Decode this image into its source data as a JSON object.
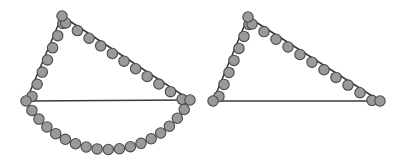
{
  "figure": {
    "background_color": "#ffffff",
    "width": 402,
    "height": 165
  },
  "style": {
    "bead_fill": "#9a9a9a",
    "bead_stroke": "#4a4a4a",
    "bead_radius": 5.2,
    "edge_stroke": "#3a3a3a",
    "edge_width": 1.6
  },
  "chart_data": {
    "type": "scatter",
    "xlabel": "",
    "ylabel": "",
    "xlim": [
      0,
      402
    ],
    "ylim": [
      0,
      165
    ],
    "grid": false,
    "legend": "none",
    "panels": [
      {
        "name": "left-figure",
        "label": "Left figure: triangle with beaded edges and semicircular arc below base",
        "vertices": {
          "apex": [
            62,
            16
          ],
          "bottom_left": [
            26,
            101
          ],
          "bottom_right": [
            190,
            100
          ]
        },
        "edges": [
          {
            "name": "left-edge",
            "from": "bottom_left",
            "to": "apex",
            "beaded": true,
            "bead_count": 7
          },
          {
            "name": "hypotenuse",
            "from": "apex",
            "to": "bottom_right",
            "beaded": true,
            "bead_count": 11
          },
          {
            "name": "base",
            "from": "bottom_left",
            "to": "bottom_right",
            "beaded": false,
            "bead_count": 0
          }
        ],
        "arc": {
          "name": "lower-semicircular-arc",
          "present": true,
          "from": "bottom_left",
          "to": "bottom_right",
          "bead_count": 17,
          "sagitta": 49
        }
      },
      {
        "name": "right-figure",
        "label": "Right figure: triangle with beaded edges, no arc below base",
        "vertices": {
          "apex": [
            248,
            17
          ],
          "bottom_left": [
            213,
            101
          ],
          "bottom_right": [
            380,
            101
          ]
        },
        "edges": [
          {
            "name": "left-edge",
            "from": "bottom_left",
            "to": "apex",
            "beaded": true,
            "bead_count": 7
          },
          {
            "name": "hypotenuse",
            "from": "apex",
            "to": "bottom_right",
            "beaded": true,
            "bead_count": 11
          },
          {
            "name": "base",
            "from": "bottom_left",
            "to": "bottom_right",
            "beaded": false,
            "bead_count": 0
          }
        ],
        "arc": {
          "name": "lower-semicircular-arc",
          "present": false,
          "from": "bottom_left",
          "to": "bottom_right",
          "bead_count": 0,
          "sagitta": 0
        }
      }
    ]
  }
}
